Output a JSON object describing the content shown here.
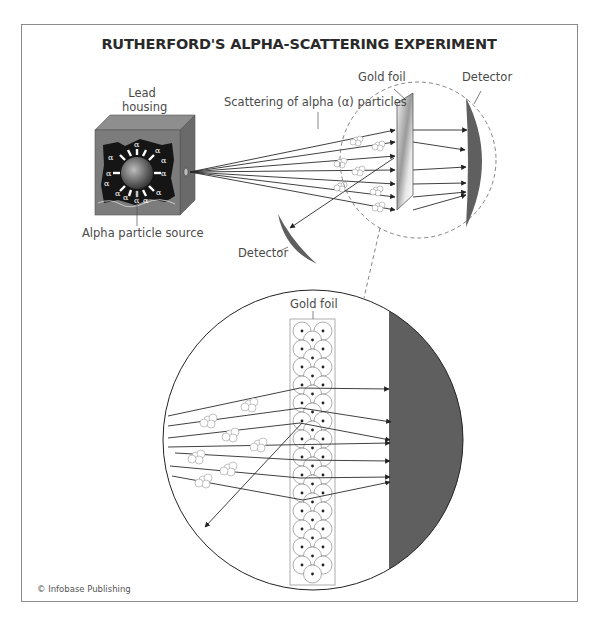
{
  "title": "RUTHERFORD'S ALPHA-SCATTERING EXPERIMENT",
  "labels": {
    "lead_housing_line1": "Lead",
    "lead_housing_line2": "housing",
    "alpha_source": "Alpha particle source",
    "scattering": "Scattering of alpha (α) particles",
    "gold_foil_top": "Gold foil",
    "detector_top": "Detector",
    "detector_left": "Detector",
    "gold_foil_zoom": "Gold foil"
  },
  "symbols": {
    "alpha": "α"
  },
  "credit": "© Infobase Publishing",
  "colors": {
    "detector": "#5f5f5f",
    "housing": "#7a7a7a",
    "housing_dark": "#1a1a1a",
    "line": "#333333",
    "frame": "#8a8a8a"
  }
}
